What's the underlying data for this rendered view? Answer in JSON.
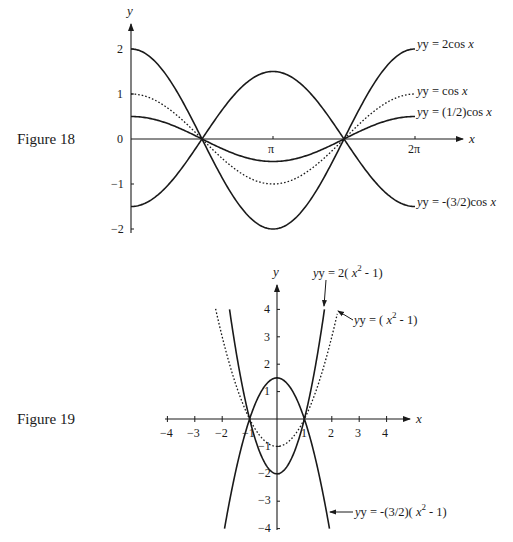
{
  "figures": [
    {
      "label": "Figure 18",
      "x_axis_name": "x",
      "y_axis_name": "y",
      "x_tick_labels": [
        "π",
        "2π"
      ],
      "y_tick_labels": [
        "2",
        "1",
        "0",
        "−1",
        "−2"
      ],
      "curve_labels": {
        "c1": {
          "prefix": "y =  2cos ",
          "var": "x"
        },
        "c2": {
          "prefix": "y =  cos ",
          "var": "x"
        },
        "c3": {
          "prefix": "y =  (1/2)cos ",
          "var": "x"
        },
        "c4": {
          "prefix": "y =  -(3/2)cos ",
          "var": "x"
        }
      }
    },
    {
      "label": "Figure 19",
      "x_axis_name": "x",
      "y_axis_name": "y",
      "x_tick_labels": [
        "−4",
        "−3",
        "−2",
        "−1",
        "1",
        "2",
        "3",
        "4"
      ],
      "y_tick_labels": [
        "4",
        "3",
        "2",
        "1",
        "−1",
        "−2",
        "−3",
        "−4"
      ],
      "curve_labels": {
        "c1": {
          "a": "y = 2( ",
          "var": "x",
          "sup": "2",
          "b": " - 1)"
        },
        "c2": {
          "a": "y = ( ",
          "var": "x",
          "sup": "2",
          "b": " - 1)"
        },
        "c3": {
          "a": "y = -(3/2)( ",
          "var": "x",
          "sup": "2",
          "b": " - 1)"
        }
      }
    }
  ],
  "chart_data": [
    {
      "type": "line",
      "title": "Figure 18",
      "xlabel": "x",
      "ylabel": "y",
      "xlim": [
        0,
        6.2832
      ],
      "ylim": [
        -2,
        2
      ],
      "x_ticks": [
        {
          "value": 3.1416,
          "label": "π"
        },
        {
          "value": 6.2832,
          "label": "2π"
        }
      ],
      "y_ticks": [
        2,
        1,
        0,
        -1,
        -2
      ],
      "grid": false,
      "legend": "inline labels at right end of curves",
      "series": [
        {
          "name": "y = 2cos x",
          "coef": 2,
          "style": "solid"
        },
        {
          "name": "y = cos x",
          "coef": 1,
          "style": "dotted"
        },
        {
          "name": "y = (1/2)cos x",
          "coef": 0.5,
          "style": "solid"
        },
        {
          "name": "y = -(3/2)cos x",
          "coef": -1.5,
          "style": "solid"
        }
      ],
      "x": [
        0,
        1.5708,
        3.1416,
        4.7124,
        6.2832
      ],
      "values": {
        "y = 2cos x": [
          2,
          0,
          -2,
          0,
          2
        ],
        "y = cos x": [
          1,
          0,
          -1,
          0,
          1
        ],
        "y = (1/2)cos x": [
          0.5,
          0,
          -0.5,
          0,
          0.5
        ],
        "y = -(3/2)cos x": [
          -1.5,
          0,
          1.5,
          0,
          -1.5
        ]
      }
    },
    {
      "type": "line",
      "title": "Figure 19",
      "xlabel": "x",
      "ylabel": "y",
      "xlim": [
        -4,
        4
      ],
      "ylim": [
        -4,
        4
      ],
      "x_ticks": [
        -4,
        -3,
        -2,
        -1,
        1,
        2,
        3,
        4
      ],
      "y_ticks": [
        4,
        3,
        2,
        1,
        -1,
        -2,
        -3,
        -4
      ],
      "grid": false,
      "legend": "inline labels with leader arrows",
      "series": [
        {
          "name": "y = 2(x^2 - 1)",
          "coef": 2,
          "style": "solid",
          "x_range": [
            -1.732,
            1.732
          ]
        },
        {
          "name": "y = (x^2 - 1)",
          "coef": 1,
          "style": "dotted",
          "x_range": [
            -2.24,
            2.2
          ]
        },
        {
          "name": "y = -(3/2)(x^2 - 1)",
          "coef": -1.5,
          "style": "solid",
          "x_range": [
            -1.915,
            1.915
          ]
        }
      ],
      "x": [
        -2,
        -1,
        0,
        1,
        2
      ],
      "values": {
        "y = 2(x^2 - 1)": [
          6,
          0,
          -2,
          0,
          6
        ],
        "y = (x^2 - 1)": [
          3,
          0,
          -1,
          0,
          3
        ],
        "y = -(3/2)(x^2 - 1)": [
          -4.5,
          0,
          1.5,
          0,
          -4.5
        ]
      }
    }
  ]
}
